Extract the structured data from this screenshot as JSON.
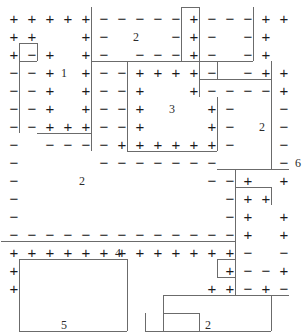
{
  "puzzle": {
    "title": "magnet-grid-puzzle",
    "columns": 16,
    "rows": 16,
    "cell_size": 18,
    "origin_x": 5,
    "origin_y": 10,
    "symbols": {
      "plus": "+",
      "minus": "−",
      "empty": ""
    },
    "colors": {
      "symbol": "#1a1a1a",
      "label": "#2b2b2b",
      "border": "#6b6b6b",
      "background": "#ffffff"
    },
    "grid": [
      [
        "+",
        "+",
        "+",
        "+",
        "+",
        "-",
        "-",
        "-",
        "-",
        "-",
        "+",
        "-",
        "-",
        "-",
        "+",
        "+"
      ],
      [
        "+",
        "+",
        "",
        "",
        "+",
        "-",
        "",
        "",
        "",
        "-",
        "+",
        "-",
        "",
        "-",
        "+",
        ""
      ],
      [
        "+",
        "-",
        "+",
        "",
        "+",
        "-",
        "",
        "-",
        "-",
        "-",
        "+",
        "-",
        "",
        "-",
        "+",
        ""
      ],
      [
        "-",
        "-",
        "+",
        "",
        "+",
        "-",
        "-",
        "+",
        "+",
        "+",
        "+",
        "-",
        "",
        "-",
        "+",
        "+"
      ],
      [
        "-",
        "-",
        "+",
        "",
        "+",
        "-",
        "-",
        "+",
        "",
        "",
        "+",
        "-",
        "-",
        "-",
        "-",
        "+"
      ],
      [
        "-",
        "-",
        "+",
        "",
        "+",
        "-",
        "-",
        "+",
        "",
        "",
        "",
        "+",
        "-",
        "",
        "",
        "-"
      ],
      [
        "-",
        "-",
        "+",
        "+",
        "+",
        "-",
        "-",
        "+",
        "",
        "",
        "",
        "+",
        "-",
        "",
        "",
        "-"
      ],
      [
        "-",
        "",
        "-",
        "-",
        "-",
        "-",
        "+",
        "+",
        "+",
        "+",
        "+",
        "+",
        "-",
        "",
        "",
        "-"
      ],
      [
        "-",
        "",
        "",
        "",
        "",
        "-",
        "-",
        "-",
        "-",
        "-",
        "-",
        "-",
        "",
        "",
        "",
        "-"
      ],
      [
        "-",
        "",
        "",
        "",
        "",
        "",
        "",
        "",
        "",
        "",
        "",
        "-",
        "-",
        "+",
        "",
        "+"
      ],
      [
        "-",
        "",
        "",
        "",
        "",
        "",
        "",
        "",
        "",
        "",
        "",
        "",
        "-",
        "+",
        "+",
        ""
      ],
      [
        "-",
        "",
        "",
        "",
        "",
        "",
        "",
        "",
        "",
        "",
        "",
        "",
        "-",
        "+",
        "",
        "+"
      ],
      [
        "-",
        "-",
        "-",
        "-",
        "-",
        "-",
        "-",
        "-",
        "-",
        "-",
        "-",
        "-",
        "-",
        "+",
        "",
        "+"
      ],
      [
        "+",
        "+",
        "+",
        "+",
        "+",
        "+",
        "+",
        "+",
        "+",
        "+",
        "+",
        "+",
        "+",
        "-",
        "",
        "-"
      ],
      [
        "+",
        "",
        "",
        "",
        "",
        "",
        "",
        "",
        "",
        "",
        "",
        "",
        "+",
        "-",
        "-",
        "+"
      ],
      [
        "+",
        "",
        "",
        "",
        "",
        "",
        "",
        "",
        "",
        "",
        "",
        "+",
        "+",
        "-",
        "+",
        "-"
      ]
    ],
    "region_labels": [
      {
        "name": "region-1",
        "text": "1",
        "col": 3,
        "row": 3
      },
      {
        "name": "region-2-top",
        "text": "2",
        "col": 7,
        "row": 1
      },
      {
        "name": "region-3",
        "text": "3",
        "col": 9,
        "row": 5
      },
      {
        "name": "region-2-right",
        "text": "2",
        "col": 14,
        "row": 6
      },
      {
        "name": "region-2-left",
        "text": "2",
        "col": 4,
        "row": 9
      },
      {
        "name": "region-6",
        "text": "6",
        "col": 16,
        "row": 8
      },
      {
        "name": "region-4",
        "text": "4",
        "col": 6,
        "row": 13
      },
      {
        "name": "region-5",
        "text": "5",
        "col": 3,
        "row": 17
      },
      {
        "name": "region-2-bottom",
        "text": "2",
        "col": 11,
        "row": 17
      }
    ]
  }
}
